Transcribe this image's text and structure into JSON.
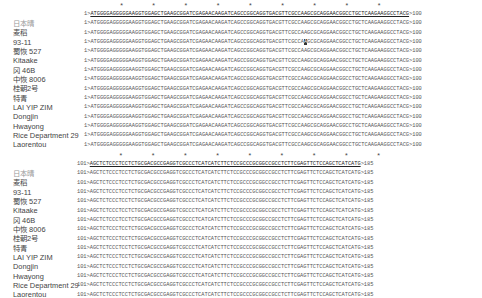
{
  "figure": {
    "block1": {
      "ruler_marks": [
        "*",
        "*",
        "*",
        "*",
        "*",
        "*",
        "*",
        "*",
        "*"
      ],
      "start": "1",
      "end": "100",
      "consensus": "ATGGGGAGGGGGAAGGTGGAGCTGAAGCGGATCGAGAACAAGATCAGCCGGCAGGTGACGTTCGCCAAGCGCAGGAACGGCCTGCTCAAGAAGGCCTACG",
      "rows": [
        {
          "name": "日本晴",
          "seq": "ATGGGGAGGGGGAAGGTGGAGCTGAAGCGGATCGAGAACAAGATCAGCCGGCAGGTGACGTTCGCCAAGCGCAGGAACGGCCTGCTCAAGAAGGCCTACG"
        },
        {
          "name": "麦稻",
          "seq": "ATGGGGAGGGGGAAGGTGGAGCTGAAGCGGATCGAGAACAAGATCAGCCGGCAGGTGACGTTCGCCAAGCGCAGGAACGGCCTGCTCAAGAAGGCCTACG"
        },
        {
          "name": "93-11",
          "seq": "ATGGGGAGGGGGAAGGTGGAGCTGAAGCGGATCGAGAACAAGATCAGCCGGCAGGTGACGTTCGCCAAGCGCAGGAACGGCCTGCTCAAGAAGGCCTACG",
          "highlight_index": 67
        },
        {
          "name": "蜀恢 527",
          "seq": "ATGGGGAGGGGGAAGGTGGAGCTGAAGCGGATCGAGAACAAGATCAGCCGGCAGGTGACGTTCGCCAAGCGCAGGAACGGCCTGCTCAAGAAGGCCTACG"
        },
        {
          "name": "Kitaake",
          "seq": "ATGGGGAGGGGGAAGGTGGAGCTGAAGCGGATCGAGAACAAGATCAGCCGGCAGGTGACGTTCGCCAAGCGCAGGAACGGCCTGCTCAAGAAGGCCTACG"
        },
        {
          "name": "冈 46B",
          "seq": "ATGGGGAGGGGGAAGGTGGAGCTGAAGCGGATCGAGAACAAGATCAGCCGGCAGGTGACGTTCGCCAAGCGCAGGAACGGCCTGCTCAAGAAGGCCTACG"
        },
        {
          "name": "中恢 8006",
          "seq": "ATGGGGAGGGGGAAGGTGGAGCTGAAGCGGATCGAGAACAAGATCAGCCGGCAGGTGACGTTCGCCAAGCGCAGGAACGGCCTGCTCAAGAAGGCCTACG"
        },
        {
          "name": "桂朝2号",
          "seq": "ATGGGGAGGGGGAAGGTGGAGCTGAAGCGGATCGAGAACAAGATCAGCCGGCAGGTGACGTTCGCCAAGCGCAGGAACGGCCTGCTCAAGAAGGCCTACG"
        },
        {
          "name": "特青",
          "seq": "ATGGGGAGGGGGAAGGTGGAGCTGAAGCGGATCGAGAACAAGATCAGCCGGCAGGTGACGTTCGCCAAGCGCAGGAACGGCCTGCTCAAGAAGGCCTACG"
        },
        {
          "name": "LAI YIP ZIM",
          "seq": "ATGGGGAGGGGGAAGGTGGAGCTGAAGCGGATCGAGAACAAGATCAGCCGGCAGGTGACGTTCGCCAAGCGCAGGAACGGCCTGCTCAAGAAGGCCTACG"
        },
        {
          "name": "Dongjin",
          "seq": "ATGGGGAGGGGGAAGGTGGAGCTGAAGCGGATCGAGAACAAGATCAGCCGGCAGGTGACGTTCGCCAAGCGCAGGAACGGCCTGCTCAAGAAGGCCTACG"
        },
        {
          "name": "Hwayong",
          "seq": "ATGGGGAGGGGGAAGGTGGAGCTGAAGCGGATCGAGAACAAGATCAGCCGGCAGGTGACGTTCGCCAAGCGCAGGAACGGCCTGCTCAAGAAGGCCTACG"
        },
        {
          "name": "Rice Department 29",
          "seq": "ATGGGGAGGGGGAAGGTGGAGCTGAAGCGGATCGAGAACAAGATCAGCCGGCAGGTGACGTTCGCCAAGCGCAGGAACGGCCTGCTCAAGAAGGCCTACG"
        },
        {
          "name": "Laorentou",
          "seq": "ATGGGGAGGGGGAAGGTGGAGCTGAAGCGGATCGAGAACAAGATCAGCCGGCAGGTGACGTTCGCCAAGCGCAGGAACGGCCTGCTCAAGAAGGCCTACG"
        }
      ]
    },
    "block2": {
      "ruler_marks": [
        "*",
        "*",
        "*",
        "*",
        "*",
        "*",
        "*",
        "*",
        "*"
      ],
      "start": "101",
      "end": "185",
      "consensus": "AGCTCTCCCTCCTCTGCGACGCCGAGGTCGCCCTCATCATCTTCTCCGCCCGCGGCCGCCTCTTCGAGTTCTCCAGCTCATCATG",
      "rows": [
        {
          "name": "日本晴",
          "seq": "AGCTCTCCCTCCTCTGCGACGCCGAGGTCGCCCTCATCATCTTCTCCGCCCGCGGCCGCCTCTTCGAGTTCTCCAGCTCATCATG"
        },
        {
          "name": "麦稻",
          "seq": "AGCTCTCCCTCCTCTGCGACGCCGAGGTCGCCCTCATCATCTTCTCCGCCCGCGGCCGCCTCTTCGAGTTCTCCAGCTCATCATG"
        },
        {
          "name": "93-11",
          "seq": "AGCTCTCCCTCCTCTGCGACGCCGAGGTCGCCCTCATCATCTTCTCCGCCCGCGGCCGCCTCTTCGAGTTCTCCAGCTCATCATG"
        },
        {
          "name": "蜀恢 527",
          "seq": "AGCTCTCCCTCCTCTGCGACGCCGAGGTCGCCCTCATCATCTTCTCCGCCCGCGGCCGCCTCTTCGAGTTCTCCAGCTCATCATG"
        },
        {
          "name": "Kitaake",
          "seq": "AGCTCTCCCTCCTCTGCGACGCCGAGGTCGCCCTCATCATCTTCTCCGCCCGCGGCCGCCTCTTCGAGTTCTCCAGCTCATCATG"
        },
        {
          "name": "冈 46B",
          "seq": "AGCTCTCCCTCCTCTGCGACGCCGAGGTCGCCCTCATCATCTTCTCCGCCCGCGGCCGCCTCTTCGAGTTCTCCAGCTCATCATG"
        },
        {
          "name": "中恢 8006",
          "seq": "AGCTCTCCCTCCTCTGCGACGCCGAGGTCGCCCTCATCATCTTCTCCGCCCGCGGCCGCCTCTTCGAGTTCTCCAGCTCATCATG"
        },
        {
          "name": "桂朝2号",
          "seq": "AGCTCTCCCTCCTCTGCGACGCCGAGGTCGCCCTCATCATCTTCTCCGCCCGCGGCCGCCTCTTCGAGTTCTCCAGCTCATCATG"
        },
        {
          "name": "特青",
          "seq": "AGCTCTCCCTCCTCTGCGACGCCGAGGTCGCCCTCATCATCTTCTCCGCCCGCGGCCGCCTCTTCGAGTTCTCCAGCTCATCATG"
        },
        {
          "name": "LAI YIP ZIM",
          "seq": "AGCTCTCCCTCCTCTGCGACGCCGAGGTCGCCCTCATCATCTTCTCCGCCCGCGGCCGCCTCTTCGAGTTCTCCAGCTCATCATG"
        },
        {
          "name": "Dongjin",
          "seq": "AGCTCTCCCTCCTCTGCGACGCCGAGGTCGCCCTCATCATCTTCTCCGCCCGCGGCCGCCTCTTCGAGTTCTCCAGCTCATCATG"
        },
        {
          "name": "Hwayong",
          "seq": "AGCTCTCCCTCCTCTGCGACGCCGAGGTCGCCCTCATCATCTTCTCCGCCCGCGGCCGCCTCTTCGAGTTCTCCAGCTCATCATG"
        },
        {
          "name": "Rice Department 29",
          "seq": "AGCTCTCCCTCCTCTGCGACGCCGAGGTCGCCCTCATCATCTTCTCCGCCCGCGGCCGCCTCTTCGAGTTCTCCAGCTCATCATG"
        },
        {
          "name": "Laorentou",
          "seq": "AGCTCTCCCTCCTCTGCGACGCCGAGGTCGCCCTCATCATCTTCTCCGCCCGCGGCCGCCTCTTCGAGTTCTCCAGCTCATCATG"
        }
      ]
    }
  }
}
